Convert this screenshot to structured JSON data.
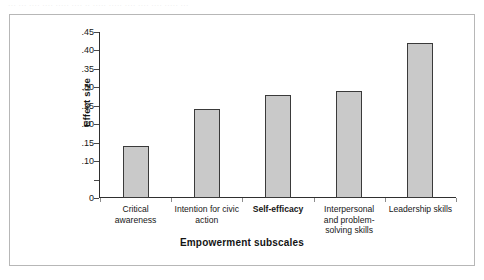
{
  "top_fragment": "··· ··· ···· ···· ····· ···· ·· ····· ····· ···· ···· ···· ····· ···",
  "chart_data": {
    "type": "bar",
    "title": "",
    "xlabel": "Empowerment subscales",
    "ylabel": "Effect size",
    "categories": [
      "Critical awareness",
      "Intention for civic action",
      "Self-efficacy",
      "Interpersonal and problem-solving skills",
      "Leadership skills"
    ],
    "category_lines": [
      [
        "Critical",
        "awareness"
      ],
      [
        "Intention for civic",
        "action"
      ],
      [
        "Self-efficacy"
      ],
      [
        "Interpersonal",
        "and problem-",
        "solving skills"
      ],
      [
        "Leadership skills"
      ]
    ],
    "category_bold": [
      false,
      false,
      true,
      false,
      false
    ],
    "values": [
      0.14,
      0.24,
      0.28,
      0.29,
      0.42
    ],
    "ylim": [
      0,
      0.45
    ],
    "ytick_values": [
      0.45,
      0.4,
      0.35,
      0.3,
      0.25,
      0.2,
      0.15,
      0.1,
      0.05,
      0
    ],
    "ytick_labels": [
      ".45",
      ".40",
      ".35",
      ".30",
      ".25",
      ".20",
      ".15",
      ".10",
      "",
      "0"
    ],
    "grid": false,
    "legend": "none",
    "bar_fill_color": "#c9c9c9",
    "bar_border_color": "#3a3a3a",
    "axis_color": "#2f2f2f",
    "frame_color": "#b7b7b7"
  }
}
